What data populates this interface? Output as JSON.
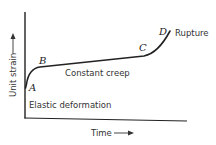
{
  "diagram": {
    "title": "",
    "y_axis_label": "Unit strain",
    "x_axis_label": "Time",
    "points": {
      "A": "A",
      "B": "B",
      "C": "C",
      "D": "D"
    },
    "annotations": {
      "rupture": "Rupture",
      "constant_creep": "Constant creep",
      "elastic_deformation": "Elastic deformation"
    },
    "colors": {
      "line": "#222222",
      "text": "#333333",
      "background": "#ffffff"
    }
  }
}
